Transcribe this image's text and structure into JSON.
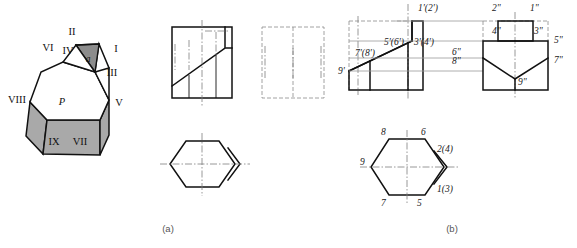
{
  "figure": {
    "captions": [
      {
        "id": "caption-a",
        "text": "(a)",
        "x": 168,
        "y": 232
      },
      {
        "id": "caption-b",
        "text": "(b)",
        "x": 452,
        "y": 232
      }
    ]
  },
  "panel_a": {
    "isometric": {
      "name": "truncated-prism-pictorial",
      "face_label_P": "P",
      "face_label_Q": "Q",
      "vertex_labels": [
        {
          "text": "II",
          "x": 72,
          "y": 35
        },
        {
          "text": "IV",
          "x": 68,
          "y": 53
        },
        {
          "text": "VI",
          "x": 48,
          "y": 50
        },
        {
          "text": "I",
          "x": 113,
          "y": 50
        },
        {
          "text": "III",
          "x": 107,
          "y": 75
        },
        {
          "text": "V",
          "x": 113,
          "y": 104
        },
        {
          "text": "VIII",
          "x": 11,
          "y": 101
        },
        {
          "text": "IX",
          "x": 50,
          "y": 144
        },
        {
          "text": "VII",
          "x": 76,
          "y": 144
        }
      ]
    },
    "front_view": {
      "name": "front-view-a"
    },
    "side_view": {
      "name": "side-view-a"
    },
    "top_view": {
      "name": "top-view-a"
    }
  },
  "panel_b": {
    "front_view": {
      "name": "front-view-b",
      "labels": [
        {
          "text": "1'(2')",
          "x": 417,
          "y": 10
        },
        {
          "text": "5'(6')",
          "x": 387,
          "y": 44
        },
        {
          "text": "3'(4')",
          "x": 420,
          "y": 44
        },
        {
          "text": "7'(8')",
          "x": 358,
          "y": 52
        },
        {
          "text": "9'",
          "x": 341,
          "y": 72
        },
        {
          "text": "6\"",
          "x": 457,
          "y": 53
        },
        {
          "text": "8\"",
          "x": 457,
          "y": 62
        }
      ]
    },
    "side_view": {
      "name": "side-view-b",
      "labels": [
        {
          "text": "2\"",
          "x": 496,
          "y": 10
        },
        {
          "text": "1\"",
          "x": 532,
          "y": 10
        },
        {
          "text": "4\"",
          "x": 497,
          "y": 31
        },
        {
          "text": "3\"",
          "x": 537,
          "y": 31
        },
        {
          "text": "5\"",
          "x": 558,
          "y": 42
        },
        {
          "text": "7\"",
          "x": 558,
          "y": 61
        },
        {
          "text": "9\"",
          "x": 521,
          "y": 81
        }
      ]
    },
    "top_view": {
      "name": "top-view-b",
      "labels": [
        {
          "text": "8",
          "x": 383,
          "y": 132
        },
        {
          "text": "6",
          "x": 423,
          "y": 132
        },
        {
          "text": "2(4)",
          "x": 440,
          "y": 150
        },
        {
          "text": "9",
          "x": 363,
          "y": 166
        },
        {
          "text": "1(3)",
          "x": 440,
          "y": 189
        },
        {
          "text": "7",
          "x": 383,
          "y": 204
        },
        {
          "text": "5",
          "x": 419,
          "y": 204
        }
      ]
    }
  },
  "colors": {
    "ink": "#111111",
    "shade": "#a9a9a9",
    "shade_dark": "#8c8c8c",
    "faint": "#9a9a9a",
    "center": "#7d7d7d",
    "caption": "#555555",
    "paper": "#ffffff"
  }
}
